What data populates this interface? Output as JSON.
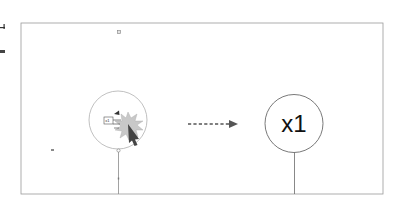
{
  "diagram": {
    "type": "click-action-illustration",
    "frame": {
      "x": 21,
      "y": 23,
      "width": 362,
      "height": 171,
      "stroke": "#9a9a9a"
    },
    "source_node": {
      "label": "x1",
      "center": [
        118,
        120
      ],
      "radius": 29,
      "stroke": "#b0b0b0",
      "contains": [
        "x1-tag-box",
        "click-burst",
        "cursor-arrow",
        "marker-triangle"
      ]
    },
    "action": {
      "label": "click",
      "burst_color": "#c8c8c8",
      "cursor_color": "#444444"
    },
    "arrow": {
      "style": "dashed",
      "from": [
        188,
        124
      ],
      "to": [
        237,
        124
      ],
      "color": "#555555"
    },
    "target_node": {
      "label": "x1",
      "center": [
        294,
        124
      ],
      "radius": 29,
      "stroke": "#6a6a6a"
    },
    "markers": [
      {
        "name": "top-marker",
        "x": 119,
        "y": 32
      },
      {
        "name": "left-marker",
        "x": 52,
        "y": 150
      }
    ],
    "colors": {
      "frame": "#9a9a9a",
      "node_stroke_light": "#b0b0b0",
      "node_stroke_dark": "#6a6a6a",
      "text": "#111111",
      "marker": "#8a8a8a"
    }
  }
}
